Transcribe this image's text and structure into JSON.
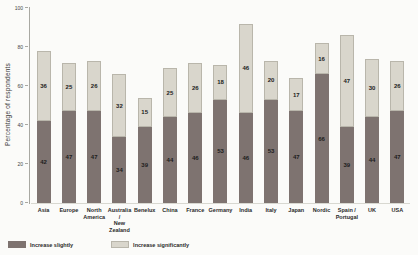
{
  "chart_data": {
    "type": "bar",
    "stacked": true,
    "title": "",
    "xlabel": "",
    "ylabel": "Percentage of respondents",
    "ylim": [
      0,
      100
    ],
    "yticks": [
      0,
      20,
      40,
      60,
      80,
      100
    ],
    "grid": false,
    "legend_position": "bottom-left",
    "categories": [
      "Asia",
      "Europe",
      "North America",
      "Australia / New Zealand",
      "Benelux",
      "China",
      "France",
      "Germany",
      "India",
      "Italy",
      "Japan",
      "Nordic",
      "Spain / Portugal",
      "UK",
      "USA"
    ],
    "categories_display": [
      [
        "Asia"
      ],
      [
        "Europe"
      ],
      [
        "North",
        "America"
      ],
      [
        "Australia /",
        "New Zealand"
      ],
      [
        "Benelux"
      ],
      [
        "China"
      ],
      [
        "France"
      ],
      [
        "Germany"
      ],
      [
        "India"
      ],
      [
        "Italy"
      ],
      [
        "Japan"
      ],
      [
        "Nordic"
      ],
      [
        "Spain /",
        "Portugal"
      ],
      [
        "UK"
      ],
      [
        "USA"
      ]
    ],
    "series": [
      {
        "name": "Increase slightly",
        "color": "#7e7370",
        "values": [
          42,
          47,
          47,
          34,
          39,
          44,
          46,
          53,
          46,
          53,
          47,
          66,
          39,
          44,
          47
        ]
      },
      {
        "name": "Increase significantly",
        "color": "#d9d6cc",
        "values": [
          36,
          25,
          26,
          32,
          15,
          25,
          26,
          18,
          46,
          20,
          17,
          16,
          47,
          30,
          26
        ]
      }
    ]
  },
  "colors": {
    "axis": "#a8a8a2",
    "text": "#2a2a2a",
    "background": "#fbfbf9"
  }
}
